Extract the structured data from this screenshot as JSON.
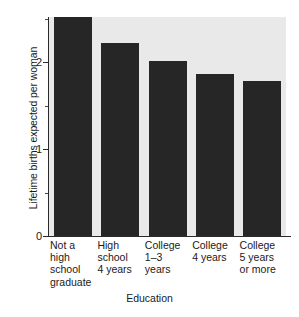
{
  "chart_data": {
    "type": "bar",
    "title": "",
    "subtitle": "",
    "xlabel": "Education",
    "ylabel": "Lifetime births expected per woman",
    "categories": [
      "Not a\nhigh\nschool\ngraduate",
      "High\nschool\n4 years",
      "College\n1–3\nyears",
      "College\n4 years",
      "College\n5 years\nor more"
    ],
    "values": [
      2.5,
      2.2,
      2.0,
      1.85,
      1.77
    ],
    "ylim": [
      0,
      2.5
    ],
    "xlim_note": "categorical, 5 bars",
    "y_major_ticks": [
      0,
      1,
      2
    ],
    "y_major_tick_labels": [
      "0",
      "1",
      "2"
    ],
    "y_minor_ticks": [
      0.5,
      1.5,
      2.5
    ],
    "grid": false,
    "legend": null,
    "legend_position": "none",
    "bar_color": "#262626",
    "plot_background": "#e9e9e9",
    "figure_background": "#ffffff",
    "axis_color": "#2a2a2a",
    "annotations": []
  },
  "axes": {
    "y_tick_0": "0",
    "y_tick_1": "1",
    "y_tick_2": "2"
  }
}
